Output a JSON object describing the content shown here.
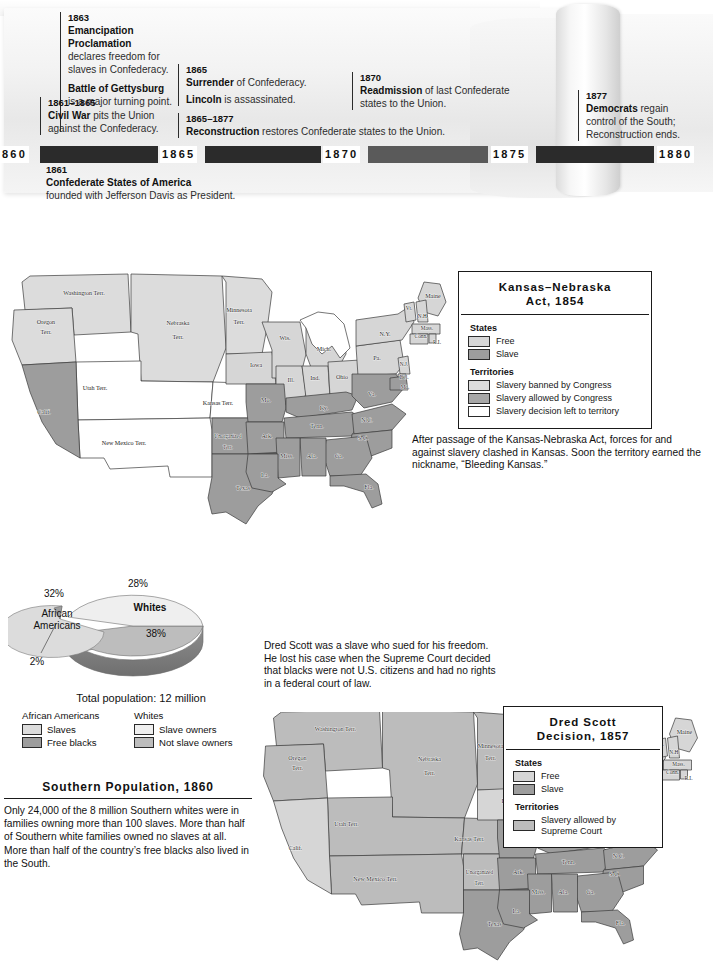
{
  "timeline": {
    "years": [
      "860",
      "1865",
      "1870",
      "1875",
      "1880"
    ],
    "events": [
      {
        "year": "1863",
        "lines": [
          {
            "bold": "Emancipation Proclamation",
            "rest": ""
          },
          {
            "bold": "",
            "rest": "declares freedom for slaves in Confederacy."
          }
        ]
      },
      {
        "year": "",
        "lines": [
          {
            "bold": "Battle of Gettysburg",
            "rest": ""
          },
          {
            "bold": "",
            "rest": "is a major turning point."
          }
        ]
      },
      {
        "year": "1861–1865",
        "lines": [
          {
            "bold": "Civil War",
            "rest": " pits the Union"
          },
          {
            "bold": "",
            "rest": "against the Confederacy."
          }
        ]
      },
      {
        "year": "1865",
        "lines": [
          {
            "bold": "Surrender",
            "rest": " of Confederacy."
          },
          {
            "bold": "Lincoln",
            "rest": " is assassinated."
          }
        ]
      },
      {
        "year": "1865–1877",
        "lines": [
          {
            "bold": "Reconstruction",
            "rest": " restores Confederate states to the Union."
          }
        ]
      },
      {
        "year": "1870",
        "lines": [
          {
            "bold": "Readmission",
            "rest": " of last Confederate"
          },
          {
            "bold": "",
            "rest": "states to the Union."
          }
        ]
      },
      {
        "year": "1877",
        "lines": [
          {
            "bold": "Democrats",
            "rest": " regain"
          },
          {
            "bold": "",
            "rest": "control of the South;"
          },
          {
            "bold": "",
            "rest": "Reconstruction ends."
          }
        ]
      },
      {
        "year": "1861",
        "lines": [
          {
            "bold": "Confederate States of America",
            "rest": ""
          },
          {
            "bold": "",
            "rest": "founded with Jefferson Davis as President."
          }
        ]
      }
    ]
  },
  "map1": {
    "legend": {
      "title_line1": "Kansas–Nebraska",
      "title_line2": "Act, 1854",
      "states_head": "States",
      "states_items": [
        {
          "label": "Free",
          "color": "#d6d6d6"
        },
        {
          "label": "Slave",
          "color": "#9d9d9d"
        }
      ],
      "territories_head": "Territories",
      "territories_items": [
        {
          "label": "Slavery banned by Congress",
          "color": "#dcdcdc"
        },
        {
          "label": "Slavery allowed by Congress",
          "color": "#a8a8a8"
        },
        {
          "label": "Slavery decision left to territory",
          "color": "#ffffff"
        }
      ]
    },
    "caption": "After passage of the Kansas-Nebraska Act, forces for and against slavery clashed in Kansas. Soon the territory earned the nickname, “Bleeding Kansas.”",
    "labels": [
      {
        "t": "Washington Terr.",
        "x": 84,
        "y": 33,
        "cls": "sm"
      },
      {
        "t": "Oregon",
        "x": 46,
        "y": 62,
        "cls": "sm"
      },
      {
        "t": "Terr.",
        "x": 46,
        "y": 72,
        "cls": "sm"
      },
      {
        "t": "Calif.",
        "x": 44,
        "y": 152,
        "cls": "sm"
      },
      {
        "t": "Utah  Terr.",
        "x": 95,
        "y": 128,
        "cls": "sm"
      },
      {
        "t": "New Mexico Terr.",
        "x": 124,
        "y": 183,
        "cls": "sm"
      },
      {
        "t": "Nebraska",
        "x": 178,
        "y": 63,
        "cls": "sm"
      },
      {
        "t": "Terr.",
        "x": 178,
        "y": 77,
        "cls": "sm"
      },
      {
        "t": "Kansas Terr.",
        "x": 218,
        "y": 143,
        "cls": "sm"
      },
      {
        "t": "Unorganized",
        "x": 228,
        "y": 176,
        "cls": "xs"
      },
      {
        "t": "Terr.",
        "x": 228,
        "y": 187,
        "cls": "xs"
      },
      {
        "t": "Texas",
        "x": 243,
        "y": 228,
        "cls": "sm"
      },
      {
        "t": "Minnesota",
        "x": 239,
        "y": 50,
        "cls": "sm"
      },
      {
        "t": "Terr.",
        "x": 239,
        "y": 62,
        "cls": "sm"
      },
      {
        "t": "Wis.",
        "x": 285,
        "y": 78,
        "cls": "sm"
      },
      {
        "t": "Mich.",
        "x": 324,
        "y": 89,
        "cls": "sm"
      },
      {
        "t": "Iowa",
        "x": 256,
        "y": 105,
        "cls": "sm"
      },
      {
        "t": "Ill.",
        "x": 291,
        "y": 120,
        "cls": "sm"
      },
      {
        "t": "Ind.",
        "x": 315,
        "y": 118,
        "cls": "sm"
      },
      {
        "t": "Ohio",
        "x": 342,
        "y": 117,
        "cls": "sm"
      },
      {
        "t": "Mo.",
        "x": 266,
        "y": 140,
        "cls": "sm"
      },
      {
        "t": "Ky.",
        "x": 324,
        "y": 148,
        "cls": "sm"
      },
      {
        "t": "Tenn.",
        "x": 317,
        "y": 166,
        "cls": "sm"
      },
      {
        "t": "Ark.",
        "x": 267,
        "y": 176,
        "cls": "sm"
      },
      {
        "t": "Miss.",
        "x": 287,
        "y": 196,
        "cls": "sm"
      },
      {
        "t": "Ala.",
        "x": 312,
        "y": 196,
        "cls": "sm"
      },
      {
        "t": "Ga.",
        "x": 339,
        "y": 196,
        "cls": "sm"
      },
      {
        "t": "La.",
        "x": 265,
        "y": 215,
        "cls": "sm"
      },
      {
        "t": "Fla.",
        "x": 369,
        "y": 227,
        "cls": "sm"
      },
      {
        "t": "S.C.",
        "x": 363,
        "y": 178,
        "cls": "sm"
      },
      {
        "t": "N.C.",
        "x": 367,
        "y": 160,
        "cls": "sm"
      },
      {
        "t": "Va.",
        "x": 372,
        "y": 134,
        "cls": "sm"
      },
      {
        "t": "Pa.",
        "x": 377,
        "y": 98,
        "cls": "sm"
      },
      {
        "t": "N.Y.",
        "x": 385,
        "y": 74,
        "cls": "sm"
      },
      {
        "t": "Maine",
        "x": 433,
        "y": 36,
        "cls": "sm"
      },
      {
        "t": "Vt.",
        "x": 409,
        "y": 48,
        "cls": "xs"
      },
      {
        "t": "N.H.",
        "x": 423,
        "y": 56,
        "cls": "xs"
      },
      {
        "t": "Mass.",
        "x": 427,
        "y": 68,
        "cls": "xs"
      },
      {
        "t": "Conn.",
        "x": 421,
        "y": 76,
        "cls": "xs"
      },
      {
        "t": "R.I.",
        "x": 437,
        "y": 82,
        "cls": "xs"
      },
      {
        "t": "N.J.",
        "x": 404,
        "y": 104,
        "cls": "xs"
      },
      {
        "t": "Del.",
        "x": 404,
        "y": 117,
        "cls": "xs"
      },
      {
        "t": "Md.",
        "x": 405,
        "y": 127,
        "cls": "xs"
      }
    ]
  },
  "map2": {
    "legend": {
      "title_line1": "Dred Scott",
      "title_line2": "Decision, 1857",
      "states_head": "States",
      "states_items": [
        {
          "label": "Free",
          "color": "#d6d6d6"
        },
        {
          "label": "Slave",
          "color": "#9d9d9d"
        }
      ],
      "territories_head": "Territories",
      "territories_items": [
        {
          "label": "Slavery allowed by Supreme Court",
          "color": "#bcbcbc"
        }
      ]
    },
    "caption": "Dred Scott was a slave who sued for his freedom. He lost his case when the Supreme Court decided that blacks were not U.S. citizens and had no rights in a federal court of law.",
    "labels": [
      {
        "t": "Washington Terr.",
        "x": 84,
        "y": 33,
        "cls": "sm"
      },
      {
        "t": "Oregon",
        "x": 46,
        "y": 62,
        "cls": "sm"
      },
      {
        "t": "Terr.",
        "x": 46,
        "y": 72,
        "cls": "sm"
      },
      {
        "t": "Calif.",
        "x": 44,
        "y": 152,
        "cls": "sm"
      },
      {
        "t": "Utah  Terr.",
        "x": 95,
        "y": 128,
        "cls": "sm"
      },
      {
        "t": "New Mexico Terr.",
        "x": 124,
        "y": 183,
        "cls": "sm"
      },
      {
        "t": "Nebraska",
        "x": 178,
        "y": 63,
        "cls": "sm"
      },
      {
        "t": "Terr.",
        "x": 178,
        "y": 77,
        "cls": "sm"
      },
      {
        "t": "Kansas Terr.",
        "x": 218,
        "y": 143,
        "cls": "sm"
      },
      {
        "t": "Unorganized",
        "x": 228,
        "y": 176,
        "cls": "xs"
      },
      {
        "t": "Terr.",
        "x": 228,
        "y": 187,
        "cls": "xs"
      },
      {
        "t": "Texas",
        "x": 243,
        "y": 228,
        "cls": "sm"
      },
      {
        "t": "Minnesota",
        "x": 239,
        "y": 50,
        "cls": "sm"
      },
      {
        "t": "Terr.",
        "x": 239,
        "y": 62,
        "cls": "sm"
      },
      {
        "t": "Wis.",
        "x": 285,
        "y": 78,
        "cls": "sm"
      },
      {
        "t": "Mich.",
        "x": 324,
        "y": 89,
        "cls": "sm"
      },
      {
        "t": "Iowa",
        "x": 256,
        "y": 105,
        "cls": "sm"
      },
      {
        "t": "Ill.",
        "x": 291,
        "y": 120,
        "cls": "sm"
      },
      {
        "t": "Ind.",
        "x": 315,
        "y": 118,
        "cls": "sm"
      },
      {
        "t": "Ohio",
        "x": 342,
        "y": 117,
        "cls": "sm"
      },
      {
        "t": "Mo.",
        "x": 266,
        "y": 140,
        "cls": "sm"
      },
      {
        "t": "Ky.",
        "x": 324,
        "y": 148,
        "cls": "sm"
      },
      {
        "t": "Tenn.",
        "x": 317,
        "y": 166,
        "cls": "sm"
      },
      {
        "t": "Ark.",
        "x": 267,
        "y": 176,
        "cls": "sm"
      },
      {
        "t": "Miss.",
        "x": 287,
        "y": 196,
        "cls": "sm"
      },
      {
        "t": "Ala.",
        "x": 312,
        "y": 196,
        "cls": "sm"
      },
      {
        "t": "Ga.",
        "x": 339,
        "y": 196,
        "cls": "sm"
      },
      {
        "t": "La.",
        "x": 265,
        "y": 215,
        "cls": "sm"
      },
      {
        "t": "Fla.",
        "x": 369,
        "y": 227,
        "cls": "sm"
      },
      {
        "t": "S.C.",
        "x": 363,
        "y": 178,
        "cls": "sm"
      },
      {
        "t": "N.C.",
        "x": 367,
        "y": 160,
        "cls": "sm"
      },
      {
        "t": "Va.",
        "x": 372,
        "y": 134,
        "cls": "sm"
      },
      {
        "t": "Pa.",
        "x": 377,
        "y": 98,
        "cls": "sm"
      },
      {
        "t": "N.Y.",
        "x": 385,
        "y": 74,
        "cls": "sm"
      },
      {
        "t": "Maine",
        "x": 433,
        "y": 36,
        "cls": "sm"
      },
      {
        "t": "Vt.",
        "x": 409,
        "y": 48,
        "cls": "xs"
      },
      {
        "t": "N.H.",
        "x": 423,
        "y": 56,
        "cls": "xs"
      },
      {
        "t": "Mass.",
        "x": 427,
        "y": 68,
        "cls": "xs"
      },
      {
        "t": "Conn.",
        "x": 421,
        "y": 76,
        "cls": "xs"
      },
      {
        "t": "R.I.",
        "x": 437,
        "y": 82,
        "cls": "xs"
      },
      {
        "t": "N.J.",
        "x": 404,
        "y": 104,
        "cls": "xs"
      },
      {
        "t": "Del.",
        "x": 404,
        "y": 117,
        "cls": "xs"
      },
      {
        "t": "Md.",
        "x": 405,
        "y": 127,
        "cls": "xs"
      }
    ]
  },
  "southern_population": {
    "title": "Southern Population, 1860",
    "body": "Only 24,000 of the 8 million Southern whites were in families owning more than 100 slaves. More than half of Southern white families owned no slaves at all. More than half of the country’s free blacks also lived in the South.",
    "total_population": "Total population: 12 million",
    "legend_columns": [
      {
        "head": "African Americans",
        "items": [
          {
            "label": "Slaves",
            "color": "#dcdcdc"
          },
          {
            "label": "Free blacks",
            "color": "#9d9d9d"
          }
        ]
      },
      {
        "head": "Whites",
        "items": [
          {
            "label": "Slave owners",
            "color": "#efefef"
          },
          {
            "label": "Not slave owners",
            "color": "#bdbdbd"
          }
        ]
      }
    ]
  },
  "chart_data": {
    "type": "pie",
    "title": "Southern Population, 1860",
    "subtitle": "Total population: 12 million",
    "categories": [
      "Whites – slave owners",
      "Whites – not slave owners",
      "African Americans – slaves",
      "African Americans – free blacks"
    ],
    "values": [
      28,
      38,
      32,
      2
    ],
    "value_labels": [
      "28%",
      "38%",
      "32%",
      "2%"
    ],
    "group_labels": [
      "Whites",
      "African Americans"
    ],
    "colors": [
      "#efefef",
      "#bdbdbd",
      "#dcdcdc",
      "#9d9d9d"
    ],
    "legend_position": "below",
    "exploded_slices": [
      "African Americans – slaves",
      "African Americans – free blacks"
    ],
    "annotations": [
      "28%",
      "Whites",
      "38%",
      "32%",
      "African Americans",
      "2%"
    ]
  }
}
